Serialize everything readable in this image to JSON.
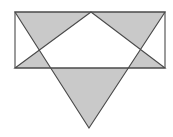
{
  "figure": {
    "canvas": {
      "width": 173,
      "height": 137,
      "background_color": "#ffffff"
    },
    "colors": {
      "shaded_fill": "#c9c9c9",
      "unshaded_fill": "#ffffff",
      "outline_stroke": "#4a4a4a",
      "background": "#ffffff"
    },
    "stroke_width": 1.1,
    "shapes": [
      {
        "name": "rectangle",
        "type": "rectangle",
        "points": [
          [
            15,
            12
          ],
          [
            165,
            12
          ],
          [
            165,
            68
          ],
          [
            15,
            68
          ]
        ],
        "filled": false
      },
      {
        "name": "upward-triangle",
        "type": "triangle",
        "points": [
          [
            91,
            12
          ],
          [
            165,
            68
          ],
          [
            15,
            68
          ]
        ],
        "filled": true,
        "apex": "top-center"
      },
      {
        "name": "downward-triangle",
        "type": "triangle",
        "points": [
          [
            15,
            12
          ],
          [
            165,
            12
          ],
          [
            89,
            128
          ]
        ],
        "filled": true,
        "apex": "bottom-center"
      }
    ],
    "intersection_points": [
      {
        "name": "left-crossing",
        "x": 45,
        "y": 53
      },
      {
        "name": "right-crossing",
        "x": 133,
        "y": 53
      }
    ],
    "white_core": {
      "name": "central-hexagon",
      "points": [
        [
          91,
          12
        ],
        [
          133,
          53
        ],
        [
          113,
          68
        ],
        [
          66,
          68
        ],
        [
          45,
          53
        ]
      ]
    }
  }
}
